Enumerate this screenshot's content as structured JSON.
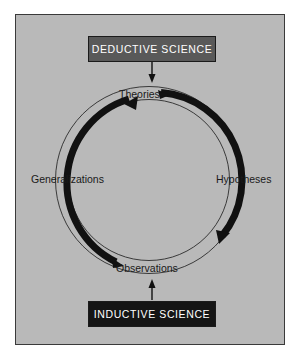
{
  "figure": {
    "background_color": "#b9b9b9",
    "frame_border_color": "#3a3a3a",
    "page_background": "#ffffff"
  },
  "boxes": [
    {
      "id": "deductive",
      "label": "DEDUCTIVE SCIENCE",
      "fill": "#595959",
      "text_color": "#ffffff",
      "position": "top"
    },
    {
      "id": "inductive",
      "label": "INDUCTIVE SCIENCE",
      "fill": "#151515",
      "text_color": "#ffffff",
      "position": "bottom"
    }
  ],
  "cycle": {
    "stages": [
      {
        "id": "theories",
        "label": "Theories",
        "position": "top"
      },
      {
        "id": "hypotheses",
        "label": "Hypotheses",
        "position": "right"
      },
      {
        "id": "observations",
        "label": "Observations",
        "position": "bottom"
      },
      {
        "id": "generalizations",
        "label": "Generalizations",
        "position": "left"
      }
    ],
    "ring_color": "#111111",
    "guide_circle_color": "#3a3a3a",
    "arcs": [
      {
        "id": "right-arc",
        "from": "theories",
        "to": "hypotheses-observations",
        "direction": "clockwise-descending"
      },
      {
        "id": "left-arc",
        "from": "observations",
        "to": "generalizations-theories",
        "direction": "counterclockwise-ascending"
      }
    ]
  },
  "connectors": [
    {
      "id": "deductive-to-theories",
      "from": "deductive",
      "to": "theories",
      "direction": "down"
    },
    {
      "id": "inductive-to-observations",
      "from": "inductive",
      "to": "observations",
      "direction": "up"
    }
  ]
}
